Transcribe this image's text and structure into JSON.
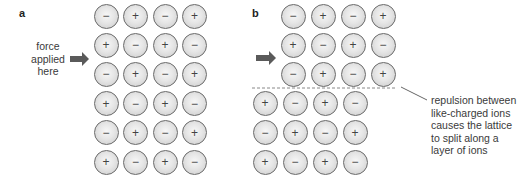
{
  "panel_a": {
    "label": "a",
    "force_text": [
      "force",
      "applied",
      "here"
    ],
    "lattice": [
      [
        "−",
        "+",
        "−",
        "+"
      ],
      [
        "+",
        "−",
        "+",
        "−"
      ],
      [
        "−",
        "+",
        "−",
        "+"
      ],
      [
        "+",
        "−",
        "+",
        "−"
      ],
      [
        "−",
        "+",
        "−",
        "+"
      ],
      [
        "+",
        "−",
        "+",
        "−"
      ]
    ]
  },
  "panel_b": {
    "label": "b",
    "upper_lattice": [
      [
        "−",
        "+",
        "−",
        "+"
      ],
      [
        "+",
        "−",
        "+",
        "−"
      ],
      [
        "−",
        "+",
        "−",
        "+"
      ]
    ],
    "lower_lattice": [
      [
        "+",
        "−",
        "+",
        "−"
      ],
      [
        "−",
        "+",
        "−",
        "+"
      ],
      [
        "+",
        "−",
        "+",
        "−"
      ]
    ],
    "annotation": [
      "repulsion between",
      "like-charged ions",
      "causes the lattice",
      "to split along a",
      "layer of ions"
    ]
  },
  "colors": {
    "arrow": "#5a5a5a",
    "ion_border": "#6a6a6a",
    "dashed_line": "#888888"
  }
}
